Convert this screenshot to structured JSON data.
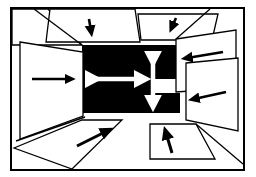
{
  "figure": {
    "description": "A rectangular outer frame encloses a drawing of a room interior. A solid black rectangle forms the far back wall. Flat white quadrilateral panels represent the ceiling, left wall, two overlapping right wall panels, and floor. Each white panel carries a solid black arrow; the black back wall carries two white double-headed arrows.",
    "canvas": {
      "width": 256,
      "height": 177
    },
    "colors": {
      "background": "#ffffff",
      "ink": "#000000",
      "back_wall_fill": "#000000",
      "panel_fill": "#ffffff",
      "white_arrow": "#ffffff",
      "black_arrow": "#000000"
    },
    "outer_frame": {
      "label": "outer border rectangle",
      "x": 10,
      "y": 7,
      "width": 235,
      "height": 164,
      "stroke_width": 2
    },
    "back_wall": {
      "label": "black back wall",
      "x": 82,
      "y": 45,
      "width": 98,
      "height": 68,
      "notch": {
        "x": 155,
        "y": 79,
        "width": 25,
        "height": 14
      }
    },
    "panels": [
      {
        "name": "ceiling-panel-left",
        "role": "ceiling",
        "points": "12,9 48,9 82,45 82,45 12,45",
        "arrow": null
      },
      {
        "name": "ceiling-panel-center",
        "role": "ceiling",
        "points": "50,9 135,9 140,42 46,42",
        "arrow": {
          "name": "ceiling-center-arrow",
          "direction": "down",
          "x1": 89,
          "y1": 19,
          "x2": 91,
          "y2": 31,
          "head": "end",
          "width": 2.6
        }
      },
      {
        "name": "ceiling-panel-right",
        "role": "ceiling",
        "points": "138,14 218,14 212,40 141,40",
        "arrow": {
          "name": "ceiling-right-arrow",
          "direction": "down-left",
          "x1": 176,
          "y1": 18,
          "x2": 172,
          "y2": 27,
          "head": "end",
          "width": 2.6
        }
      },
      {
        "name": "left-wall-panel",
        "role": "left wall",
        "points": "20,42 83,52 83,116 20,139",
        "arrow": {
          "name": "left-wall-arrow",
          "direction": "right",
          "x1": 32,
          "y1": 79,
          "x2": 70,
          "y2": 79,
          "head": "end",
          "width": 2.4
        }
      },
      {
        "name": "right-wall-panel-upper",
        "role": "right wall",
        "points": "176,39 236,30 236,88 176,92",
        "arrow": {
          "name": "right-wall-upper-arrow",
          "direction": "left",
          "x1": 223,
          "y1": 52,
          "x2": 187,
          "y2": 58,
          "head": "end",
          "width": 2.6
        }
      },
      {
        "name": "right-wall-panel-lower",
        "role": "right wall",
        "points": "186,63 238,58 238,131 186,120",
        "arrow": {
          "name": "right-wall-lower-arrow",
          "direction": "left",
          "x1": 226,
          "y1": 92,
          "x2": 194,
          "y2": 99,
          "head": "end",
          "width": 2.6
        }
      },
      {
        "name": "floor-panel-left",
        "role": "floor",
        "points": "14,148 82,120 122,120 72,169",
        "arrow": {
          "name": "floor-left-arrow",
          "direction": "up-right",
          "x1": 77,
          "y1": 146,
          "x2": 107,
          "y2": 131,
          "head": "end",
          "width": 3.0
        }
      },
      {
        "name": "floor-panel-right",
        "role": "floor",
        "points": "150,124 196,124 215,159 150,159",
        "arrow": {
          "name": "floor-right-arrow",
          "direction": "up",
          "x1": 172,
          "y1": 153,
          "x2": 166,
          "y2": 133,
          "head": "end",
          "width": 3.0
        }
      }
    ],
    "perspective_lines": [
      {
        "name": "ceiling-vanishing-line-left",
        "x1": 34,
        "y1": 9,
        "x2": 82,
        "y2": 45
      },
      {
        "name": "ceiling-vanishing-line-right",
        "x1": 210,
        "y1": 9,
        "x2": 176,
        "y2": 39
      },
      {
        "name": "floor-vanishing-line-left",
        "x1": 12,
        "y1": 160,
        "x2": 84,
        "y2": 118
      },
      {
        "name": "floor-vanishing-line-right",
        "x1": 243,
        "y1": 164,
        "x2": 196,
        "y2": 124
      },
      {
        "name": "floor-edge-line",
        "x1": 16,
        "y1": 141,
        "x2": 85,
        "y2": 117
      }
    ],
    "center_arrows": [
      {
        "name": "horizontal-double-arrow",
        "orientation": "horizontal",
        "double_headed": true,
        "color": "#ffffff",
        "x1": 92,
        "y1": 79,
        "x2": 141,
        "y2": 79,
        "width": 4.5,
        "head_size": 7
      },
      {
        "name": "vertical-double-arrow",
        "orientation": "vertical",
        "double_headed": true,
        "color": "#ffffff",
        "x1": 153,
        "y1": 58,
        "x2": 153,
        "y2": 102,
        "width": 4.5,
        "head_size": 7
      }
    ]
  }
}
